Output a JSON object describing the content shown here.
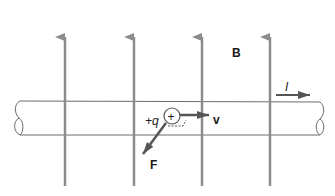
{
  "diagram": {
    "labels": {
      "field": "B",
      "current": "I",
      "charge": "+q",
      "charge_sign": "+",
      "velocity": "v",
      "force": "F"
    },
    "colors": {
      "field_lines": "#8c8c8c",
      "arrows": "#555555",
      "wire_outline": "#555555",
      "text": "#1a1a1a",
      "background": "#ffffff"
    },
    "field_lines_x": [
      65,
      134,
      202,
      270
    ]
  }
}
